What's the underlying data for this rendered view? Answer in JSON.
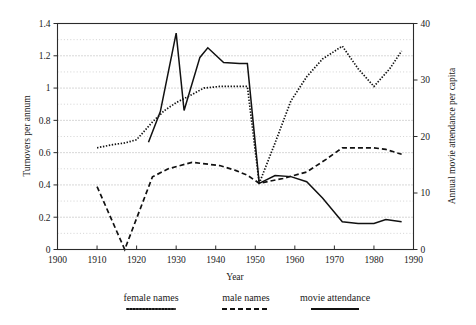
{
  "chart_data": {
    "type": "line",
    "title": "",
    "xlabel": "Year",
    "ylabel": "Turnovers per annum",
    "y2label": "Annual movie attendance per capita",
    "xlim": [
      1900,
      1990
    ],
    "ylim": [
      0,
      1.4
    ],
    "y2lim": [
      0,
      40
    ],
    "grid": true,
    "legend_position": "bottom-outside",
    "xticks": [
      1900,
      1910,
      1920,
      1930,
      1940,
      1950,
      1960,
      1970,
      1980,
      1990
    ],
    "xticklabels": [
      "1900",
      "1910",
      "1920",
      "1930",
      "1940",
      "1950",
      "1960",
      "1970",
      "1980",
      "1990"
    ],
    "yticks": [
      0,
      0.2,
      0.4,
      0.6,
      0.8,
      1,
      1.2,
      1.4
    ],
    "yticklabels": [
      "0",
      "0.2",
      "0.4",
      "0.6",
      "0.8",
      "1",
      "1.2",
      "1.4"
    ],
    "y2ticks": [
      0,
      10,
      20,
      30,
      40
    ],
    "y2ticklabels": [
      "0",
      "10",
      "20",
      "30",
      "40"
    ],
    "minor_yticks": [
      0.1,
      0.3,
      0.5,
      0.7,
      0.9,
      1.1,
      1.3
    ],
    "series": [
      {
        "name": "female names",
        "axis": "left",
        "style": "dotted",
        "x": [
          1910,
          1914,
          1917,
          1920,
          1924,
          1927,
          1930,
          1934,
          1937,
          1941,
          1945,
          1948,
          1951,
          1955,
          1959,
          1963,
          1967,
          1972,
          1976,
          1980,
          1984,
          1987
        ],
        "y": [
          0.63,
          0.65,
          0.66,
          0.68,
          0.79,
          0.86,
          0.91,
          0.96,
          1.0,
          1.01,
          1.01,
          1.01,
          0.41,
          0.66,
          0.92,
          1.07,
          1.18,
          1.26,
          1.12,
          1.01,
          1.12,
          1.23
        ]
      },
      {
        "name": "male names",
        "axis": "left",
        "style": "dashed",
        "x": [
          1910,
          1917,
          1924,
          1928,
          1934,
          1941,
          1945,
          1948,
          1951,
          1957,
          1963,
          1968,
          1972,
          1976,
          1980,
          1983,
          1987
        ],
        "y": [
          0.39,
          0.0,
          0.45,
          0.5,
          0.54,
          0.52,
          0.49,
          0.46,
          0.41,
          0.44,
          0.48,
          0.56,
          0.63,
          0.63,
          0.63,
          0.62,
          0.59
        ]
      },
      {
        "name": "movie attendance",
        "axis": "right",
        "style": "solid",
        "x": [
          1923,
          1926,
          1930,
          1932,
          1936,
          1938,
          1942,
          1946,
          1948,
          1951,
          1955,
          1959,
          1963,
          1967,
          1972,
          1976,
          1980,
          1983,
          1987
        ],
        "y": [
          19.0,
          24.4,
          38.3,
          24.6,
          34.0,
          35.7,
          33.1,
          32.9,
          32.9,
          11.7,
          13.1,
          12.9,
          12.0,
          9.1,
          4.9,
          4.6,
          4.6,
          5.3,
          4.9
        ]
      }
    ],
    "series_left_equivalent": {
      "note": "movie attendance values expressed on the left (0-1.4) scale for drawing",
      "movie_attendance_left": [
        0.665,
        0.854,
        1.34,
        0.861,
        1.19,
        1.25,
        1.16,
        1.152,
        1.152,
        0.41,
        0.458,
        0.452,
        0.42,
        0.32,
        0.172,
        0.161,
        0.161,
        0.186,
        0.172
      ]
    }
  },
  "legend": {
    "items": [
      {
        "label": "female names",
        "style": "dotted"
      },
      {
        "label": "male names",
        "style": "dashed"
      },
      {
        "label": "movie attendance",
        "style": "solid"
      }
    ]
  },
  "colors": {
    "ink": "#111111",
    "frame": "#2b2b2b",
    "grid_major": "#8c8c8c",
    "grid_minor": "#b5b5b5",
    "background": "#ffffff"
  }
}
